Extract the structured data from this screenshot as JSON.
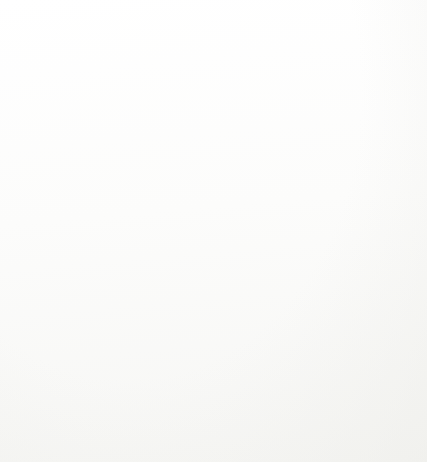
{
  "figure": {
    "kind": "contour-plot",
    "background_color": "#fdfdfc",
    "frame_color": "#b9b9b6"
  },
  "axes": {
    "x_title": "Multiples of apriori standard deviation of horizontal direction",
    "y_title": "Multiples of ariori standard deviation of distance",
    "x_ticks": [
      "0.5",
      "1",
      "1.5",
      "2",
      "2.5",
      "3",
      "3.5",
      "4",
      "4.5",
      "5"
    ],
    "y_ticks": [
      "0.5",
      "1",
      "1.5",
      "2",
      "2.5",
      "3",
      "3.5",
      "4",
      "4.5",
      "5"
    ]
  },
  "chart_data": {
    "type": "line",
    "title": "",
    "xlabel": "Multiples of apriori standard deviation of horizontal direction",
    "ylabel": "Multiples of ariori standard deviation of distance",
    "xlim": [
      0,
      5
    ],
    "ylim": [
      0,
      5
    ],
    "x_ticks": [
      0.5,
      1,
      1.5,
      2,
      2.5,
      3,
      3.5,
      4,
      4.5,
      5
    ],
    "y_ticks": [
      0.5,
      1,
      1.5,
      2,
      2.5,
      3,
      3.5,
      4,
      4.5,
      5
    ],
    "grid": false,
    "legend": "none",
    "contour_levels": [
      0.25,
      0.5,
      1,
      2
    ],
    "series": [
      {
        "name": "0.25",
        "level": 0.25,
        "color": "#8d8d8d",
        "width": 1.2,
        "points": [
          [
            3.07,
            5.0
          ],
          [
            3.07,
            4.72
          ],
          [
            3.12,
            4.62
          ],
          [
            3.12,
            4.46
          ],
          [
            3.17,
            4.4
          ],
          [
            3.17,
            4.22
          ],
          [
            3.22,
            4.16
          ],
          [
            3.22,
            4.02
          ],
          [
            3.27,
            3.96
          ],
          [
            3.27,
            3.86
          ],
          [
            3.33,
            3.8
          ],
          [
            3.41,
            3.62
          ],
          [
            3.58,
            3.35
          ],
          [
            3.74,
            3.12
          ],
          [
            3.92,
            2.9
          ],
          [
            4.06,
            2.8
          ],
          [
            4.22,
            2.76
          ],
          [
            4.3,
            2.7
          ],
          [
            4.46,
            2.66
          ],
          [
            4.54,
            2.6
          ],
          [
            4.7,
            2.56
          ],
          [
            4.78,
            2.52
          ],
          [
            5.0,
            2.5
          ]
        ],
        "labels": [
          {
            "text": "0.25",
            "x": 3.07,
            "y": 4.88
          },
          {
            "text": "0.25",
            "x": 3.44,
            "y": 3.72
          },
          {
            "text": "0.25",
            "x": 4.18,
            "y": 2.88
          }
        ]
      },
      {
        "name": "0.5",
        "level": 0.5,
        "color": "#8a8a8a",
        "width": 1.3,
        "points": [
          [
            1.33,
            5.0
          ],
          [
            1.33,
            4.74
          ],
          [
            1.38,
            4.62
          ],
          [
            1.38,
            4.44
          ],
          [
            1.44,
            4.38
          ],
          [
            1.44,
            3.8
          ],
          [
            1.5,
            3.74
          ],
          [
            1.5,
            3.46
          ],
          [
            1.56,
            3.4
          ],
          [
            1.56,
            3.08
          ],
          [
            1.61,
            3.02
          ],
          [
            1.61,
            2.78
          ],
          [
            1.67,
            2.72
          ],
          [
            1.67,
            2.52
          ],
          [
            1.72,
            2.46
          ],
          [
            1.72,
            2.3
          ],
          [
            1.83,
            2.22
          ],
          [
            1.94,
            2.05
          ],
          [
            2.11,
            1.88
          ],
          [
            2.28,
            1.7
          ],
          [
            2.39,
            1.58
          ],
          [
            2.5,
            1.52
          ],
          [
            2.61,
            1.46
          ],
          [
            2.72,
            1.44
          ],
          [
            2.83,
            1.4
          ],
          [
            2.94,
            1.35
          ],
          [
            3.06,
            1.32
          ],
          [
            3.17,
            1.28
          ],
          [
            3.33,
            1.24
          ],
          [
            3.56,
            1.2
          ],
          [
            3.78,
            1.18
          ],
          [
            4.0,
            1.16
          ],
          [
            4.22,
            1.14
          ],
          [
            4.33,
            1.1
          ],
          [
            4.56,
            1.08
          ],
          [
            5.0,
            1.07
          ]
        ],
        "labels": [
          {
            "text": "0.5",
            "x": 1.33,
            "y": 4.88
          },
          {
            "text": "0.5",
            "x": 1.44,
            "y": 3.66
          },
          {
            "text": "0.5",
            "x": 1.67,
            "y": 2.58
          },
          {
            "text": "0.5",
            "x": 2.39,
            "y": 1.58
          },
          {
            "text": "0.5",
            "x": 3.22,
            "y": 1.26
          },
          {
            "text": "0.5",
            "x": 4.5,
            "y": 1.08
          }
        ]
      },
      {
        "name": "1",
        "level": 1,
        "color": "#787878",
        "width": 1.3,
        "points": [
          [
            0.6,
            5.0
          ],
          [
            0.6,
            3.92
          ],
          [
            0.58,
            3.8
          ],
          [
            0.6,
            3.62
          ],
          [
            0.62,
            3.5
          ],
          [
            0.62,
            3.15
          ],
          [
            0.65,
            3.05
          ],
          [
            0.65,
            2.8
          ],
          [
            0.67,
            2.7
          ],
          [
            0.67,
            2.34
          ],
          [
            0.7,
            2.26
          ],
          [
            0.7,
            1.95
          ],
          [
            0.72,
            1.88
          ],
          [
            0.72,
            1.55
          ],
          [
            0.75,
            1.48
          ],
          [
            0.75,
            1.28
          ],
          [
            0.78,
            1.22
          ],
          [
            0.78,
            1.05
          ],
          [
            0.83,
            0.98
          ],
          [
            0.94,
            0.85
          ],
          [
            1.06,
            0.74
          ],
          [
            1.17,
            0.68
          ],
          [
            1.22,
            0.66
          ],
          [
            1.28,
            0.64
          ],
          [
            1.33,
            0.62
          ],
          [
            1.44,
            0.6
          ],
          [
            1.56,
            0.58
          ],
          [
            1.72,
            0.56
          ],
          [
            1.89,
            0.55
          ],
          [
            2.06,
            0.52
          ],
          [
            2.22,
            0.5
          ],
          [
            2.5,
            0.49
          ],
          [
            3.0,
            0.48
          ],
          [
            3.5,
            0.47
          ],
          [
            4.0,
            0.46
          ],
          [
            4.5,
            0.45
          ],
          [
            5.0,
            0.45
          ]
        ],
        "labels": [
          {
            "text": "1",
            "x": 0.6,
            "y": 4.88
          },
          {
            "text": "1",
            "x": 0.62,
            "y": 3.7
          },
          {
            "text": "1",
            "x": 0.67,
            "y": 2.5
          },
          {
            "text": "1",
            "x": 0.75,
            "y": 1.22
          },
          {
            "text": "1",
            "x": 1.28,
            "y": 0.63
          },
          {
            "text": "1",
            "x": 2.42,
            "y": 0.49
          },
          {
            "text": "1",
            "x": 3.83,
            "y": 0.47
          }
        ]
      },
      {
        "name": "2",
        "level": 2,
        "color": "#b0b0ae",
        "width": 1.0,
        "points": [
          [
            0.25,
            5.0
          ],
          [
            0.25,
            3.9
          ],
          [
            0.26,
            3.8
          ],
          [
            0.26,
            2.6
          ],
          [
            0.27,
            2.5
          ],
          [
            0.27,
            1.62
          ],
          [
            0.28,
            1.52
          ],
          [
            0.28,
            1.12
          ],
          [
            0.3,
            1.02
          ],
          [
            0.33,
            0.82
          ],
          [
            0.37,
            0.62
          ],
          [
            0.42,
            0.48
          ],
          [
            0.5,
            0.38
          ],
          [
            0.58,
            0.32
          ],
          [
            0.67,
            0.29
          ],
          [
            0.78,
            0.27
          ],
          [
            0.94,
            0.26
          ],
          [
            1.17,
            0.25
          ],
          [
            1.5,
            0.24
          ],
          [
            2.0,
            0.23
          ],
          [
            2.5,
            0.22
          ],
          [
            3.0,
            0.21
          ],
          [
            3.5,
            0.21
          ],
          [
            4.0,
            0.2
          ],
          [
            4.5,
            0.2
          ],
          [
            5.0,
            0.2
          ]
        ],
        "labels": [
          {
            "text": "2",
            "x": 0.25,
            "y": 4.88
          },
          {
            "text": "2",
            "x": 0.26,
            "y": 3.72
          },
          {
            "text": "2",
            "x": 0.27,
            "y": 2.52
          },
          {
            "text": "2",
            "x": 0.28,
            "y": 1.24
          },
          {
            "text": "2",
            "x": 0.6,
            "y": 0.3
          },
          {
            "text": "2",
            "x": 1.72,
            "y": 0.24
          },
          {
            "text": "2",
            "x": 2.94,
            "y": 0.22
          },
          {
            "text": "2",
            "x": 4.28,
            "y": 0.21
          }
        ]
      }
    ]
  }
}
